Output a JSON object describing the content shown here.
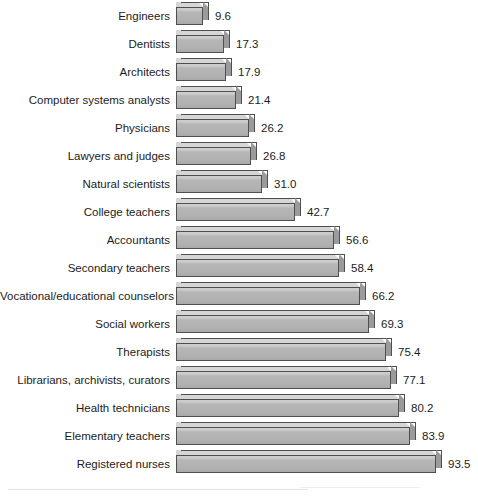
{
  "chart_data": {
    "type": "bar",
    "orientation": "horizontal",
    "title": "",
    "subtitle": "",
    "xlabel": "",
    "ylabel": "",
    "grid": false,
    "legend": null,
    "value_labels": true,
    "sorted": "ascending",
    "xlim": [
      0,
      93.5
    ],
    "categories": [
      "Engineers",
      "Dentists",
      "Architects",
      "Computer systems analysts",
      "Physicians",
      "Lawyers and judges",
      "Natural scientists",
      "College teachers",
      "Accountants",
      "Secondary teachers",
      "Vocational/educational counselors",
      "Social workers",
      "Therapists",
      "Librarians, archivists, curators",
      "Health technicians",
      "Elementary teachers",
      "Registered nurses"
    ],
    "values": [
      9.6,
      17.3,
      17.9,
      21.4,
      26.2,
      26.8,
      31.0,
      42.7,
      56.6,
      58.4,
      66.2,
      69.3,
      75.4,
      77.1,
      80.2,
      83.9,
      93.5
    ],
    "value_labels_text": [
      "9.6",
      "17.3",
      "17.9",
      "21.4",
      "26.2",
      "26.8",
      "31.0",
      "42.7",
      "56.6",
      "58.4",
      "66.2",
      "69.3",
      "75.4",
      "77.1",
      "80.2",
      "83.9",
      "93.5"
    ]
  },
  "style": {
    "bar_face_color": "#b1b1b1",
    "bar_top_color": "#d6d6d6",
    "bar_side_color": "#9b9b9b",
    "bar_outline_color": "#4f4f4f",
    "background_color": "#ffffff",
    "text_color": "#1c1c1c"
  }
}
